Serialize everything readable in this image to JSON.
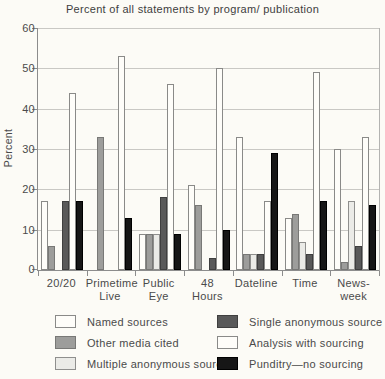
{
  "chart_data": {
    "type": "bar",
    "title": "Percent of all statements by program/ publication",
    "ylabel": "Percent",
    "xlabel": "",
    "ylim": [
      0,
      60
    ],
    "yticks": [
      0,
      10,
      20,
      30,
      40,
      50,
      60
    ],
    "grid": true,
    "legend_position": "bottom",
    "categories": [
      [
        "20/20"
      ],
      [
        "Primetime",
        "Live"
      ],
      [
        "Public",
        "Eye"
      ],
      [
        "48",
        "Hours"
      ],
      [
        "Dateline"
      ],
      [
        "Time"
      ],
      [
        "News-",
        "week"
      ]
    ],
    "series": [
      {
        "name": "Named sources",
        "color": "#fefdf9",
        "border": "#8a8a88",
        "values": [
          17,
          0,
          9,
          21,
          33,
          13,
          30
        ]
      },
      {
        "name": "Other media cited",
        "color": "#9d9d9b",
        "border": "#787876",
        "values": [
          6,
          33,
          9,
          16,
          4,
          14,
          2
        ]
      },
      {
        "name": "Multiple anonymous sources",
        "color": "#ebebe7",
        "border": "#8f8f8d",
        "values": [
          0,
          0,
          9,
          0,
          4,
          7,
          17
        ]
      },
      {
        "name": "Single anonymous source",
        "color": "#595959",
        "border": "#3f3f3f",
        "values": [
          17,
          0,
          18,
          3,
          4,
          4,
          6
        ]
      },
      {
        "name": "Analysis with sourcing",
        "color": "#fefdf9",
        "border": "#8a8a88",
        "values": [
          44,
          53,
          46,
          50,
          17,
          49,
          33
        ]
      },
      {
        "name": "Punditry—no sourcing",
        "color": "#161616",
        "border": "#000000",
        "values": [
          17,
          13,
          9,
          10,
          29,
          17,
          16
        ]
      }
    ],
    "legend_columns": [
      [
        0,
        1,
        2
      ],
      [
        3,
        4,
        5
      ]
    ]
  }
}
